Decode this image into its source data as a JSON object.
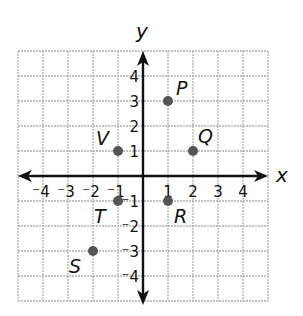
{
  "chart_data": {
    "type": "scatter",
    "title": "",
    "xlabel": "x",
    "ylabel": "y",
    "xlim": [
      -5,
      5
    ],
    "ylim": [
      -5,
      5
    ],
    "grid": true,
    "x_ticks": [
      "-4",
      "-3",
      "-2",
      "-1",
      "1",
      "2",
      "3",
      "4"
    ],
    "y_ticks": [
      "4",
      "3",
      "2",
      "1",
      "-1",
      "-2",
      "-3",
      "-4"
    ],
    "points": [
      {
        "label": "P",
        "x": 1,
        "y": 3
      },
      {
        "label": "Q",
        "x": 2,
        "y": 1
      },
      {
        "label": "R",
        "x": 1,
        "y": -1
      },
      {
        "label": "S",
        "x": -2,
        "y": -3
      },
      {
        "label": "T",
        "x": -1,
        "y": -1
      },
      {
        "label": "V",
        "x": -1,
        "y": 1
      }
    ]
  },
  "axes": {
    "x_label": "x",
    "y_label": "y"
  },
  "colors": {
    "grid": "#b0b0b0",
    "axis": "#111111",
    "point": "#555555",
    "text": "#111111"
  }
}
